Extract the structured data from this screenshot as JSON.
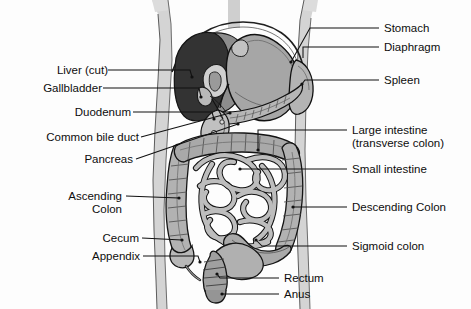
{
  "figure": {
    "palette": {
      "background": "#fdfdfd",
      "body_silhouette": "#d8d8d8",
      "body_interior": "#ffffff",
      "liver_dark": "#333333",
      "liver_light": "#8f8f8f",
      "stomach": "#a8a8a8",
      "spleen": "#b5b5b5",
      "pancreas": "#b8b8b8",
      "intestine": "#b0b0b0",
      "intestine_light": "#c6c6c6",
      "outline": "#1a1a1a",
      "leader_line": "#111111"
    }
  },
  "labels_left": [
    {
      "id": "liver-cut",
      "text": "Liver (cut)",
      "x": 36,
      "y": 64,
      "line_from_x": 108,
      "line_from_y": 70,
      "line_to_x": 190,
      "line_to_y": 77
    },
    {
      "id": "gallbladder",
      "text": "Gallbladder",
      "x": 28,
      "y": 82,
      "line_from_x": 103,
      "line_from_y": 88,
      "line_to_x": 197,
      "line_to_y": 97
    },
    {
      "id": "duodenum",
      "text": "Duodenum",
      "x": 57,
      "y": 106,
      "line_from_x": 132,
      "line_from_y": 112,
      "line_to_x": 211,
      "line_to_y": 119
    },
    {
      "id": "common-bile-duct",
      "text": "Common bile duct",
      "x": 18,
      "y": 131,
      "line_from_x": 139,
      "line_from_y": 137,
      "line_to_x": 230,
      "line_to_y": 111
    },
    {
      "id": "pancreas",
      "text": "Pancreas",
      "x": 70,
      "y": 153,
      "line_from_x": 135,
      "line_from_y": 159,
      "line_to_x": 235,
      "line_to_y": 122
    },
    {
      "id": "ascending-colon",
      "text": "Ascending\nColon",
      "line1": "Ascending",
      "line2": "Colon",
      "x": 44,
      "y": 190,
      "line_from_x": 124,
      "line_from_y": 196,
      "line_to_x": 166,
      "line_to_y": 199
    },
    {
      "id": "cecum",
      "text": "Cecum",
      "x": 86,
      "y": 232,
      "line_from_x": 141,
      "line_from_y": 238,
      "line_to_x": 188,
      "line_to_y": 240
    },
    {
      "id": "appendix",
      "text": "Appendix",
      "x": 75,
      "y": 250,
      "line_from_x": 142,
      "line_from_y": 256,
      "line_to_x": 204,
      "line_to_y": 263
    }
  ],
  "labels_right": [
    {
      "id": "stomach",
      "text": "Stomach",
      "x": 385,
      "y": 22,
      "line_from_x": 380,
      "line_from_y": 28,
      "line_to_x": 290,
      "line_to_y": 63
    },
    {
      "id": "diaphragm",
      "text": "Diaphragm",
      "x": 385,
      "y": 41,
      "line_from_x": 380,
      "line_from_y": 47,
      "line_to_x": 302,
      "line_to_y": 57
    },
    {
      "id": "spleen",
      "text": "Spleen",
      "x": 385,
      "y": 74,
      "line_from_x": 380,
      "line_from_y": 80,
      "line_to_x": 310,
      "line_to_y": 83
    },
    {
      "id": "large-intestine",
      "text": "Large intestine\n(transverse colon)",
      "line1": "Large intestine",
      "line2": "(transverse colon)",
      "x": 352,
      "y": 124,
      "line_from_x": 348,
      "line_from_y": 130,
      "line_to_x": 258,
      "line_to_y": 152
    },
    {
      "id": "small-intestine",
      "text": "Small intestine",
      "x": 352,
      "y": 163,
      "line_from_x": 348,
      "line_from_y": 169,
      "line_to_x": 242,
      "line_to_y": 172
    },
    {
      "id": "descending-colon",
      "text": "Descending Colon",
      "x": 352,
      "y": 201,
      "line_from_x": 348,
      "line_from_y": 207,
      "line_to_x": 297,
      "line_to_y": 208
    },
    {
      "id": "sigmoid-colon",
      "text": "Sigmoid colon",
      "x": 352,
      "y": 240,
      "line_from_x": 348,
      "line_from_y": 246,
      "line_to_x": 262,
      "line_to_y": 240
    }
  ],
  "labels_bottom": [
    {
      "id": "rectum",
      "text": "Rectum",
      "x": 285,
      "y": 272,
      "line_from_x": 280,
      "line_from_y": 278,
      "line_to_x": 221,
      "line_to_y": 275
    },
    {
      "id": "anus",
      "text": "Anus",
      "x": 285,
      "y": 290,
      "line_from_x": 280,
      "line_from_y": 295,
      "line_to_x": 222,
      "line_to_y": 294
    }
  ],
  "organs": [
    {
      "id": "liver",
      "name": "Liver (cut)"
    },
    {
      "id": "gallbladder",
      "name": "Gallbladder"
    },
    {
      "id": "duodenum",
      "name": "Duodenum"
    },
    {
      "id": "common-bile-duct",
      "name": "Common bile duct"
    },
    {
      "id": "pancreas",
      "name": "Pancreas"
    },
    {
      "id": "stomach",
      "name": "Stomach"
    },
    {
      "id": "diaphragm",
      "name": "Diaphragm"
    },
    {
      "id": "spleen",
      "name": "Spleen"
    },
    {
      "id": "transverse-colon",
      "name": "Large intestine (transverse colon)"
    },
    {
      "id": "small-intestine",
      "name": "Small intestine"
    },
    {
      "id": "ascending-colon",
      "name": "Ascending Colon"
    },
    {
      "id": "descending-colon",
      "name": "Descending Colon"
    },
    {
      "id": "cecum",
      "name": "Cecum"
    },
    {
      "id": "appendix",
      "name": "Appendix"
    },
    {
      "id": "sigmoid-colon",
      "name": "Sigmoid colon"
    },
    {
      "id": "rectum",
      "name": "Rectum"
    },
    {
      "id": "anus",
      "name": "Anus"
    }
  ]
}
